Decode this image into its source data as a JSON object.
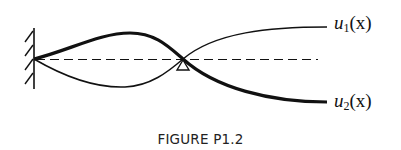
{
  "figure": {
    "caption": "FIGURE P1.2",
    "labels": {
      "u1": {
        "base": "u",
        "sub": "1",
        "arg": "(x)"
      },
      "u2": {
        "base": "u",
        "sub": "2",
        "arg": "(x)"
      }
    },
    "elements": {
      "fixed_support": "clamped wall at left end",
      "pin_support": "triangular pin support at mid-span",
      "reference_line": "dashed undeformed axis"
    },
    "colors": {
      "ink": "#111111",
      "background": "#ffffff"
    }
  }
}
